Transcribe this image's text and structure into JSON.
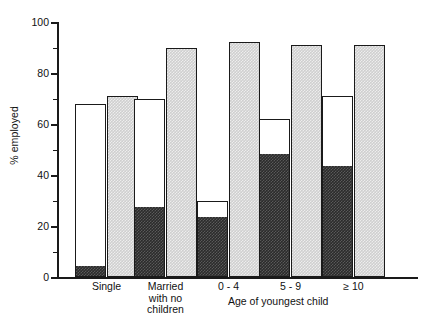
{
  "chart_data": {
    "type": "bar",
    "title": "",
    "subtitle": "",
    "xlabel": "Age of youngest child",
    "ylabel": "% employed",
    "ylim": [
      0,
      100
    ],
    "grid": false,
    "legend": "none",
    "y_major_ticks": [
      0,
      20,
      40,
      60,
      80,
      100
    ],
    "y_minor_ticks": [
      10,
      30,
      50,
      70,
      90
    ],
    "y_tick_labels": [
      "0",
      "20",
      "40",
      "60",
      "80",
      "100"
    ],
    "categories": [
      "Single",
      "Married\nwith no\nchildren",
      "0 - 4",
      "5 - 9",
      "≥ 10"
    ],
    "series": [
      {
        "name": "full-time employed",
        "fill": "black",
        "bar": "stacked-left",
        "values": [
          4,
          27,
          23,
          48,
          43
        ]
      },
      {
        "name": "all employed (left bar total)",
        "fill": "white",
        "bar": "stacked-left",
        "values": [
          68,
          70,
          30,
          62,
          71
        ]
      },
      {
        "name": "comparison group",
        "fill": "grey-hatched",
        "bar": "right",
        "values": [
          71,
          90,
          92,
          91,
          91
        ]
      }
    ]
  },
  "colors": {
    "axis": "#1a1a1a",
    "dark_fill": "#2b2b2b",
    "grey_fill": "#cfcfcf",
    "white_fill": "#ffffff",
    "background": "#ffffff"
  }
}
